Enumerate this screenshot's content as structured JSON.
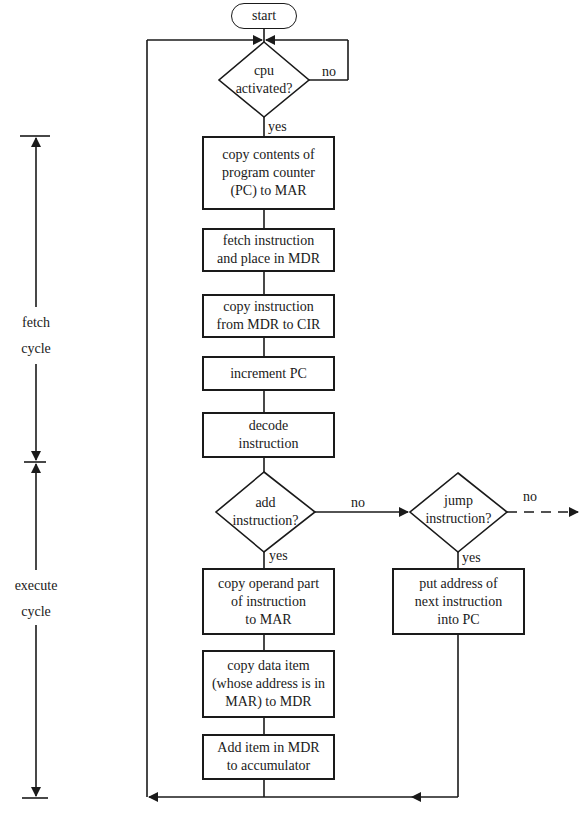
{
  "flowchart": {
    "start": "start",
    "decisions": {
      "cpu_activated": {
        "text": "cpu\nactivated?",
        "yes": "yes",
        "no": "no"
      },
      "add_instruction": {
        "text": "add\ninstruction?",
        "yes": "yes",
        "no": "no"
      },
      "jump_instruction": {
        "text": "jump\ninstruction?",
        "yes": "yes",
        "no": "no"
      }
    },
    "process": {
      "copy_pc": "copy contents of\nprogram counter\n(PC) to MAR",
      "fetch_instruction": "fetch instruction\nand place in MDR",
      "copy_instruction": "copy instruction\nfrom MDR to CIR",
      "increment_pc": "increment PC",
      "decode": "decode\ninstruction",
      "copy_operand": "copy operand part\nof instruction\nto MAR",
      "copy_data": "copy data item\n(whose address is in\nMAR) to MDR",
      "add_item": "Add item in MDR\nto accumulator",
      "put_address": "put address of\nnext instruction\ninto PC"
    }
  },
  "side_labels": {
    "fetch": "fetch\ncycle",
    "execute": "execute\ncycle"
  },
  "colors": {
    "line": "#1a1a1a",
    "background": "#ffffff"
  }
}
